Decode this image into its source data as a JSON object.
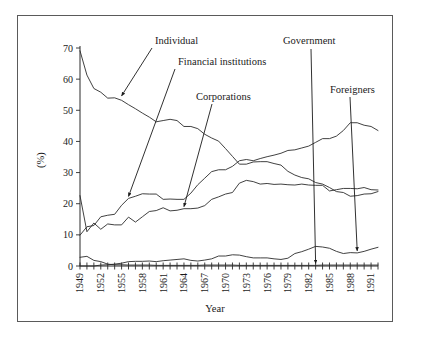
{
  "figure": {
    "frame_visible": true,
    "background_color": "#ffffff",
    "line_color": "#2b2b2b"
  },
  "chart_data": {
    "type": "line",
    "title": "",
    "xlabel": "Year",
    "ylabel": "(%)",
    "xlim": [
      1949,
      1992
    ],
    "ylim": [
      0,
      70
    ],
    "ytick_step": 10,
    "yticks": [
      "0",
      "10",
      "20",
      "30",
      "40",
      "50",
      "60",
      "70"
    ],
    "xticks": [
      "1949",
      "1952",
      "1955",
      "1958",
      "1961",
      "1964",
      "1967",
      "1970",
      "1973",
      "1976",
      "1979",
      "1982",
      "1985",
      "1988",
      "1991"
    ],
    "xtick_step": 3,
    "xtick_rotation": 90,
    "grid": false,
    "legend": "none",
    "annotations_style": "arrow-labels",
    "x": [
      1949,
      1950,
      1951,
      1952,
      1953,
      1954,
      1955,
      1956,
      1957,
      1958,
      1959,
      1960,
      1961,
      1962,
      1963,
      1964,
      1965,
      1966,
      1967,
      1968,
      1969,
      1970,
      1971,
      1972,
      1973,
      1974,
      1975,
      1976,
      1977,
      1978,
      1979,
      1980,
      1981,
      1982,
      1983,
      1984,
      1985,
      1986,
      1987,
      1988,
      1989,
      1990,
      1991,
      1992
    ],
    "series": [
      {
        "name": "Individual",
        "values": [
          69.1,
          61.3,
          57.0,
          55.8,
          53.9,
          54.0,
          53.2,
          51.8,
          50.5,
          49.1,
          47.8,
          46.3,
          46.7,
          47.1,
          46.7,
          44.8,
          44.8,
          44.1,
          42.3,
          41.1,
          40.1,
          37.7,
          35.2,
          32.7,
          32.7,
          33.4,
          33.5,
          33.5,
          32.9,
          32.4,
          30.4,
          29.2,
          28.4,
          28.0,
          26.8,
          26.3,
          25.2,
          23.9,
          23.6,
          22.4,
          22.6,
          23.1,
          23.2,
          23.9
        ]
      },
      {
        "name": "Financial institutions",
        "values": [
          9.9,
          12.6,
          13.0,
          15.8,
          16.3,
          16.6,
          19.5,
          21.7,
          22.4,
          23.2,
          23.1,
          23.1,
          21.4,
          21.5,
          21.4,
          21.4,
          23.4,
          26.1,
          28.2,
          30.3,
          30.9,
          30.9,
          32.0,
          33.8,
          34.2,
          33.8,
          34.5,
          35.1,
          35.6,
          36.2,
          37.1,
          37.3,
          37.9,
          38.5,
          39.7,
          40.9,
          40.9,
          41.7,
          43.5,
          46.0,
          46.0,
          45.2,
          44.8,
          43.5
        ]
      },
      {
        "name": "Corporations",
        "values": [
          22.6,
          11.0,
          13.8,
          11.8,
          13.5,
          13.2,
          13.2,
          15.7,
          14.1,
          15.8,
          17.5,
          17.8,
          18.7,
          17.7,
          17.9,
          18.4,
          18.4,
          18.6,
          19.4,
          21.4,
          22.2,
          23.1,
          23.6,
          26.6,
          27.5,
          27.1,
          26.3,
          26.5,
          26.2,
          26.3,
          26.1,
          26.0,
          26.3,
          26.0,
          25.9,
          25.9,
          24.1,
          24.5,
          24.9,
          24.9,
          24.8,
          25.2,
          24.5,
          24.4
        ]
      },
      {
        "name": "Government",
        "values": [
          2.8,
          3.1,
          1.8,
          1.4,
          0.6,
          0.4,
          0.4,
          0.3,
          0.3,
          0.3,
          0.3,
          0.2,
          0.2,
          0.2,
          0.2,
          0.2,
          0.2,
          0.2,
          0.3,
          0.3,
          0.3,
          0.3,
          0.3,
          0.2,
          0.2,
          0.2,
          0.2,
          0.2,
          0.2,
          0.2,
          0.2,
          0.2,
          0.2,
          0.2,
          0.2,
          0.3,
          0.3,
          0.3,
          0.3,
          0.3,
          0.3,
          0.3,
          0.3,
          0.3
        ]
      },
      {
        "name": "Foreigners",
        "values": [
          0.0,
          0.0,
          0.0,
          0.3,
          0.4,
          0.6,
          0.9,
          1.4,
          1.5,
          1.5,
          1.6,
          1.4,
          1.7,
          1.9,
          2.1,
          2.3,
          1.8,
          1.6,
          1.9,
          2.3,
          3.2,
          3.2,
          3.6,
          3.5,
          3.0,
          2.6,
          2.6,
          2.6,
          2.3,
          2.1,
          2.5,
          4.0,
          4.6,
          5.4,
          6.3,
          6.1,
          5.7,
          4.7,
          4.0,
          4.3,
          4.2,
          4.7,
          5.4,
          6.0
        ]
      }
    ],
    "annotations": [
      {
        "label": "Individual",
        "target_series": "Individual",
        "target_x": 1955,
        "target_y": 54.0
      },
      {
        "label": "Financial institutions",
        "target_series": "Financial institutions",
        "target_x": 1956,
        "target_y": 21.7
      },
      {
        "label": "Corporations",
        "target_series": "Corporations",
        "target_x": 1964,
        "target_y": 18.4
      },
      {
        "label": "Government",
        "target_series": "Government",
        "target_x": 1983,
        "target_y": 0.2
      },
      {
        "label": "Foreigners",
        "target_series": "Foreigners",
        "target_x": 1989,
        "target_y": 4.2
      }
    ]
  }
}
